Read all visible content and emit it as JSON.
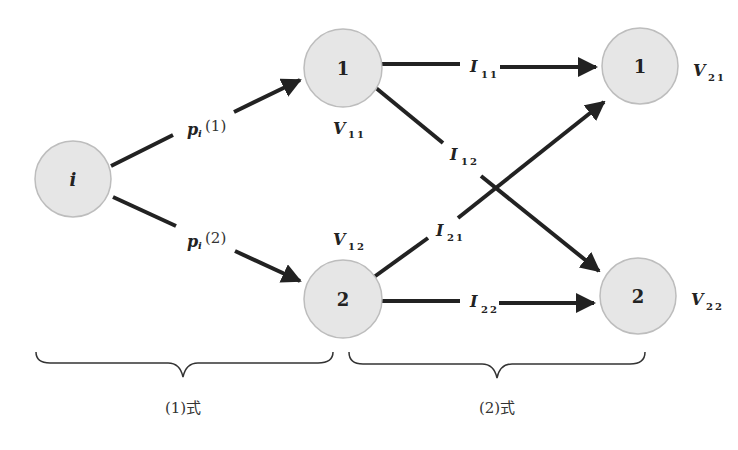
{
  "diagram": {
    "colors": {
      "node_fill": "#e6e6e6",
      "node_stroke": "#bdbdbd",
      "edge": "#222222",
      "text": "#222222"
    },
    "nodes": {
      "origin": {
        "label": "i"
      },
      "stage1_top": {
        "label": "1",
        "value_label": "V",
        "value_sub": "11"
      },
      "stage1_bottom": {
        "label": "2",
        "value_label": "V",
        "value_sub": "12"
      },
      "stage2_top": {
        "label": "1",
        "value_label": "V",
        "value_sub": "21"
      },
      "stage2_bottom": {
        "label": "2",
        "value_label": "V",
        "value_sub": "22"
      }
    },
    "edges": {
      "p1": {
        "label": "p",
        "sub": "i",
        "arg": "(1)"
      },
      "p2": {
        "label": "p",
        "sub": "i",
        "arg": "(2)"
      },
      "I11": {
        "label": "I",
        "sub": "11"
      },
      "I12": {
        "label": "I",
        "sub": "12"
      },
      "I21": {
        "label": "I",
        "sub": "21"
      },
      "I22": {
        "label": "I",
        "sub": "22"
      }
    },
    "braces": {
      "left": {
        "label": "(1)式"
      },
      "right": {
        "label": "(2)式"
      }
    }
  }
}
